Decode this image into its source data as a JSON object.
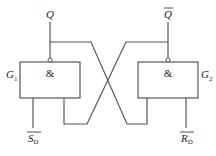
{
  "diagram": {
    "gates": [
      {
        "id": "G1",
        "name": "G",
        "subscript": "1",
        "symbol": "&",
        "input_label": "S",
        "input_subscript": "D",
        "input_overbar": true,
        "output_label": "Q",
        "output_overbar": false
      },
      {
        "id": "G2",
        "name": "G",
        "subscript": "2",
        "symbol": "&",
        "input_label": "R",
        "input_subscript": "D",
        "input_overbar": true,
        "output_label": "Q",
        "output_overbar": true
      }
    ],
    "colors": {
      "line": "#555555",
      "text": "#222222",
      "background": "#ffffff"
    }
  }
}
